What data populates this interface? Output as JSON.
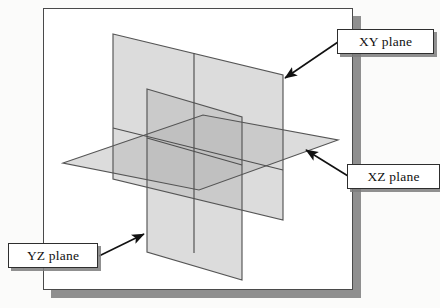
{
  "figure": {
    "frame": {
      "border_color": "#4a4a4a",
      "shadow_color": "#8f8f8f",
      "background": "#ffffff"
    },
    "planes": [
      {
        "id": "xy",
        "label": "XY plane",
        "orientation": "vertical-back",
        "fill": "#d6d6d6",
        "stroke": "#555555",
        "points": "113,34 283,75 283,220 113,179"
      },
      {
        "id": "xz",
        "label": "XZ plane",
        "orientation": "horizontal",
        "fill": "#d6d6d6",
        "stroke": "#555555",
        "points": "63,163 203,115 338,140 199,190"
      },
      {
        "id": "yz",
        "label": "YZ plane",
        "orientation": "vertical-front",
        "fill": "#d6d6d6",
        "stroke": "#555555",
        "points": "147,89 242,117 242,280 147,252"
      }
    ],
    "callouts": [
      {
        "id": "xy",
        "text": "XY plane",
        "arrow_from": [
          338,
          42
        ],
        "arrow_to": [
          281,
          80
        ]
      },
      {
        "id": "xz",
        "text": "XZ plane",
        "arrow_from": [
          348,
          176
        ],
        "arrow_to": [
          303,
          148
        ]
      },
      {
        "id": "yz",
        "text": "YZ plane",
        "arrow_from": [
          99,
          256
        ],
        "arrow_to": [
          146,
          233
        ]
      }
    ],
    "colors": {
      "plane_fill": "#d6d6d6",
      "plane_overlap_fill": "#c2c2c2",
      "plane_stroke": "#555555",
      "arrow": "#111111",
      "label_text": "#111111",
      "label_border": "#2e2e2e",
      "label_shadow": "#7d7d7d"
    }
  }
}
